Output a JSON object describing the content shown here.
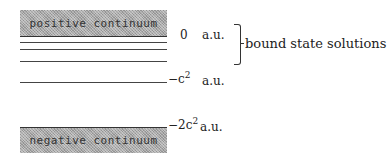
{
  "positive_continuum": {
    "label": "positive continuum"
  },
  "negative_continuum": {
    "label": "negative continuum"
  },
  "energy_levels": {
    "zero": {
      "value": "0",
      "unit": "a.u."
    },
    "minus_c2": {
      "prefix": "−c",
      "exp": "2",
      "unit": "a.u."
    },
    "minus_2c2": {
      "prefix": "−2c",
      "exp": "2",
      "unit": "a.u."
    }
  },
  "bound_states": {
    "label": "bound state solutions",
    "line_count": 4
  }
}
